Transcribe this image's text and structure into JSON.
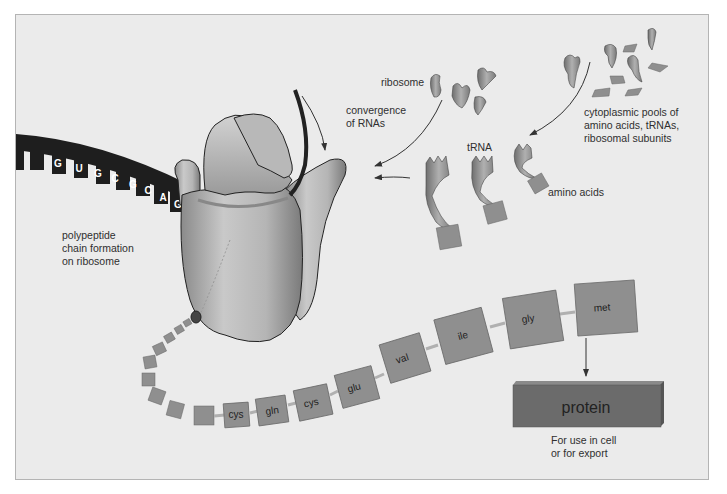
{
  "figure": {
    "colors": {
      "background": "#ebebeb",
      "frame_border": "#b4b4b4",
      "ribosome": "#b8b8b8",
      "mrna": "#1e1e1e",
      "amino_acid_box": "#8f8f8f",
      "protein_box": "#6b6b6b",
      "text": "#2f2f2f"
    }
  },
  "labels": {
    "ribosome": "ribosome",
    "convergence": [
      "convergence",
      "of RNAs"
    ],
    "cytoplasmic": [
      "cytoplasmic pools of",
      "amino acids, tRNAs,",
      "ribosomal subunits"
    ],
    "trna": "tRNA",
    "amino_acids": "amino acids",
    "polypeptide": [
      "polypeptide",
      "chain formation",
      "on ribosome"
    ],
    "protein": "protein",
    "use": [
      "For use in cell",
      "or for export"
    ]
  },
  "mrna": {
    "bases": [
      "G",
      "U",
      "G",
      "C",
      "G",
      "C",
      "A",
      "G"
    ]
  },
  "chain": {
    "residues": [
      "cys",
      "gln",
      "cys",
      "glu",
      "val",
      "ile",
      "gly",
      "met"
    ]
  }
}
